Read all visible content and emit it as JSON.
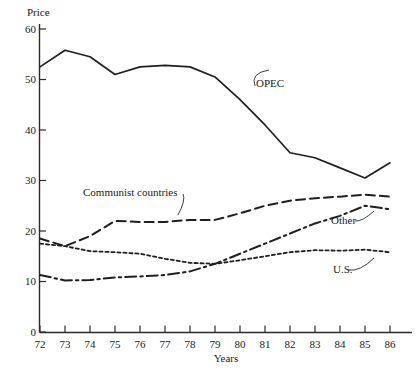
{
  "chart_data": {
    "type": "line",
    "title": "",
    "xlabel": "Years",
    "ylabel": "Price",
    "xlim": [
      72,
      86
    ],
    "ylim": [
      0,
      60
    ],
    "grid": false,
    "legend_position": "inline-annotations",
    "x": [
      72,
      73,
      74,
      75,
      76,
      77,
      78,
      79,
      80,
      81,
      82,
      83,
      84,
      85,
      86
    ],
    "xticklabels": [
      "72",
      "73",
      "74",
      "75",
      "76",
      "77",
      "78",
      "79",
      "80",
      "81",
      "82",
      "83",
      "84",
      "85",
      "86"
    ],
    "yticks": [
      0,
      10,
      20,
      30,
      40,
      50,
      60
    ],
    "yticklabels": [
      "0",
      "10",
      "20",
      "30",
      "40",
      "50",
      "60"
    ],
    "series": [
      {
        "name": "OPEC",
        "style": "solid",
        "label": "OPEC",
        "values": [
          52.5,
          55.8,
          54.5,
          51.0,
          52.5,
          52.8,
          52.5,
          50.5,
          46.0,
          41.0,
          35.5,
          34.5,
          32.5,
          30.5,
          33.5
        ]
      },
      {
        "name": "Communist countries",
        "style": "dashed",
        "label": "Communist countries",
        "values": [
          18.5,
          17.0,
          19.0,
          22.0,
          21.8,
          21.8,
          22.2,
          22.2,
          23.5,
          25.0,
          26.0,
          26.5,
          26.8,
          27.2,
          26.8
        ]
      },
      {
        "name": "Other",
        "style": "dash-dot",
        "label": "Other",
        "values": [
          11.3,
          10.2,
          10.3,
          10.8,
          11.0,
          11.3,
          12.0,
          13.5,
          15.5,
          17.5,
          19.5,
          21.5,
          23.0,
          25.0,
          24.3
        ]
      },
      {
        "name": "U.S.",
        "style": "dotted",
        "label": "U.S.",
        "values": [
          17.5,
          17.0,
          16.0,
          15.8,
          15.5,
          14.5,
          13.7,
          13.5,
          14.2,
          15.0,
          15.8,
          16.2,
          16.1,
          16.3,
          15.8
        ]
      }
    ],
    "annotations": [
      {
        "text": "OPEC",
        "x": 80.1,
        "y": 48.0
      },
      {
        "text": "Communist countries",
        "x": 74.1,
        "y": 27.3
      },
      {
        "text": "Other",
        "x": 84.2,
        "y": 21.6
      },
      {
        "text": "U.S.",
        "x": 84.2,
        "y": 11.8
      }
    ]
  }
}
